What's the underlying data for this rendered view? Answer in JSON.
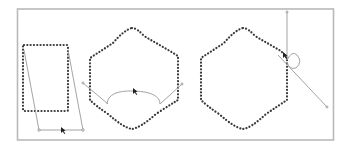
{
  "figure": {
    "colors": {
      "frame": "#b9b9b9",
      "dotted_path": "#3a3a3a",
      "handle_line": "#9a9a9a",
      "cursor": "#1f1f1f",
      "background": "#ffffff"
    },
    "panels": [
      {
        "name": "rectangle-skew",
        "shape": "dotted rectangle",
        "handles": "trapezoid guide with bottom handle bar"
      },
      {
        "name": "hexagon-curve-drag",
        "shape": "dotted hexagon with concave sides",
        "handles": "curved arc handle below shape"
      },
      {
        "name": "hexagon-handle-rotate",
        "shape": "dotted hexagon with concave sides",
        "handles": "vertical and diagonal handle lines with loop"
      }
    ]
  }
}
